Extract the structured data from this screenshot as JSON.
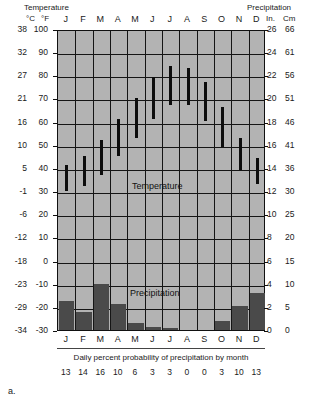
{
  "header": {
    "temperature_title": "Temperature",
    "precipitation_title": "Precipitation",
    "unit_celsius": "°C",
    "unit_fahrenheit": "°F",
    "unit_inches": "In.",
    "unit_centimeters": "Cm"
  },
  "labels": {
    "temperature_band": "Temperature",
    "precipitation_band": "Precipitation",
    "footer_caption": "Daily percent probability of precipitation by month",
    "figure_label": "a."
  },
  "colors": {
    "plot_background": "#b3b3b3",
    "grid": "#151515",
    "temperature_bar": "#0d0d0d",
    "precipitation_bar": "#4a4a4a",
    "text": "#1a1a1a"
  },
  "chart_data": {
    "type": "bar",
    "xlabel": "",
    "ylabel": "Temperature",
    "grid": true,
    "legend_position": "none",
    "categories": [
      "J",
      "F",
      "M",
      "A",
      "M",
      "J",
      "J",
      "A",
      "S",
      "O",
      "N",
      "D"
    ],
    "left_axis": {
      "name": "Temperature",
      "unit_primary": "°C",
      "unit_secondary": "°F",
      "ticks_celsius": [
        38,
        32,
        27,
        21,
        16,
        10,
        5,
        -1,
        -6,
        -12,
        -18,
        -23,
        -29,
        -34
      ],
      "ticks_fahrenheit": [
        100,
        90,
        80,
        70,
        60,
        50,
        40,
        30,
        20,
        10,
        0,
        -10,
        -20,
        -30
      ],
      "ylim_fahrenheit": [
        -30,
        100
      ]
    },
    "right_axis": {
      "name": "Precipitation",
      "unit_primary": "In.",
      "unit_secondary": "Cm",
      "ticks_inches": [
        26,
        24,
        22,
        20,
        18,
        16,
        14,
        12,
        10,
        8,
        6,
        4,
        2,
        0
      ],
      "ticks_centimeters": [
        66,
        61,
        56,
        51,
        46,
        41,
        36,
        30,
        25,
        20,
        15,
        10,
        5,
        0
      ],
      "ylim_inches": [
        0,
        26
      ]
    },
    "series": [
      {
        "name": "Temperature range (°F)",
        "type": "range-bar",
        "unit": "°F",
        "low": [
          31,
          33,
          38,
          46,
          54,
          62,
          68,
          68,
          61,
          50,
          40,
          34
        ],
        "high": [
          42,
          46,
          53,
          62,
          71,
          80,
          85,
          84,
          78,
          67,
          54,
          45
        ]
      },
      {
        "name": "Precipitation (In.)",
        "type": "bar",
        "unit": "In.",
        "values": [
          2.6,
          1.6,
          4.2,
          2.4,
          0.6,
          0.3,
          0.2,
          0.0,
          0.0,
          0.8,
          2.2,
          3.4
        ]
      }
    ],
    "footer_series": {
      "name": "Daily percent probability of precipitation by month",
      "unit": "%",
      "values": [
        13,
        14,
        16,
        10,
        6,
        3,
        3,
        0,
        0,
        3,
        10,
        13
      ]
    }
  }
}
